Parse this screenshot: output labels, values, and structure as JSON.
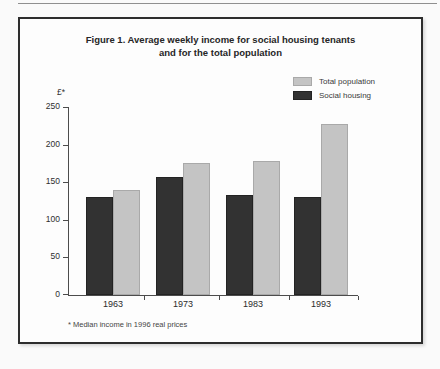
{
  "chart_data": {
    "type": "bar",
    "title": "Figure 1. Average weekly income for social housing tenants and for the total population",
    "title_lines": [
      "Figure 1. Average weekly income for social housing tenants",
      "and for the total population"
    ],
    "ylabel": "£*",
    "footnote": "* Median income in 1996 real prices",
    "categories": [
      "1963",
      "1973",
      "1983",
      "1993"
    ],
    "series": [
      {
        "name": "Total population",
        "color": "#c4c4c4",
        "border_color": "#a9a9a9",
        "values": [
          140,
          175,
          178,
          228
        ]
      },
      {
        "name": "Social housing",
        "color": "#323232",
        "border_color": "#232323",
        "values": [
          130,
          157,
          133,
          130
        ]
      }
    ],
    "bar_draw_order": [
      "Social housing",
      "Total population"
    ],
    "ylim": [
      0,
      250
    ],
    "yticks": [
      0,
      50,
      100,
      150,
      200,
      250
    ],
    "legend_position": "top-right",
    "grid": false,
    "axis_color": "#4c4c4c"
  }
}
